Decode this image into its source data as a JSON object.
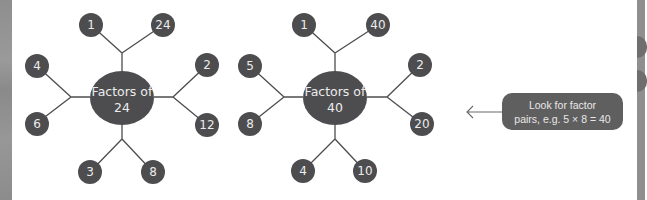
{
  "diagrams": [
    {
      "title_line1": "Factors of",
      "title_line2": "24",
      "number": 24,
      "factors": [
        "1",
        "24",
        "4",
        "6",
        "2",
        "12",
        "3",
        "8"
      ],
      "factor_pairs": [
        [
          "1",
          "24"
        ],
        [
          "4",
          "6"
        ],
        [
          "2",
          "12"
        ],
        [
          "3",
          "8"
        ]
      ]
    },
    {
      "title_line1": "Factors of",
      "title_line2": "40",
      "number": 40,
      "factors": [
        "1",
        "40",
        "5",
        "8",
        "2",
        "20",
        "4",
        "10"
      ],
      "factor_pairs": [
        [
          "1",
          "40"
        ],
        [
          "5",
          "8"
        ],
        [
          "2",
          "20"
        ],
        [
          "4",
          "10"
        ]
      ]
    }
  ],
  "callout": {
    "line1": "Look for factor",
    "line2": "pairs, e.g. 5 × 8 = 40",
    "arrow": "arrow-left-icon"
  },
  "colors": {
    "node_fill": "#4d4d4f",
    "node_text": "#ececec",
    "callout_fill": "#5f5f60",
    "background": "#ffffff"
  }
}
